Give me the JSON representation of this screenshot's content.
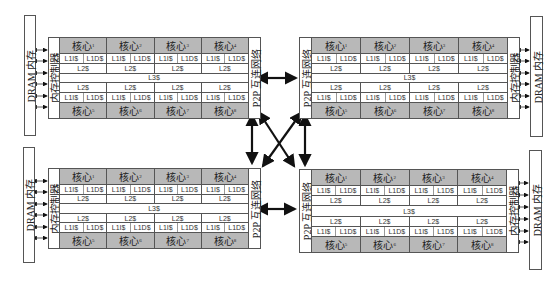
{
  "diagram": {
    "title": "",
    "labels": {
      "dram": "DRAM 内存",
      "memory_controller": "内存控制器",
      "p2p_network": "P2P 互连网络",
      "core_prefix": "核心",
      "l1i": "L1I$",
      "l1d": "L1D$",
      "l2": "L2$",
      "l3": "L3$"
    },
    "processors": [
      {
        "position": "top-left",
        "dram_label": "DRAM 内存",
        "controller_label": "内存控制器",
        "p2p_label": "P2P 互连网络",
        "top_cores": [
          "1",
          "2",
          "3",
          "4"
        ],
        "bottom_cores": [
          "5",
          "6",
          "7",
          "8"
        ]
      },
      {
        "position": "top-right",
        "dram_label": "DRAM 内存",
        "controller_label": "内存控制器",
        "p2p_label": "P2P 互连网络",
        "top_cores": [
          "1",
          "2",
          "3",
          "4"
        ],
        "bottom_cores": [
          "5",
          "6",
          "7",
          "8"
        ]
      },
      {
        "position": "bottom-left",
        "dram_label": "DRAM 内存",
        "controller_label": "内存控制器",
        "p2p_label": "P2P 互连网络",
        "top_cores": [
          "1",
          "2",
          "3",
          "4"
        ],
        "bottom_cores": [
          "5",
          "6",
          "7",
          "8"
        ]
      },
      {
        "position": "bottom-right",
        "dram_label": "DRAM 内存",
        "controller_label": "内存控制器",
        "p2p_label": "P2P 互连网络",
        "top_cores": [
          "1",
          "2",
          "3",
          "4"
        ],
        "bottom_cores": [
          "5",
          "6",
          "7",
          "8"
        ]
      }
    ],
    "connections": [
      {
        "from": "top-left",
        "to": "top-right",
        "type": "bidirectional"
      },
      {
        "from": "bottom-left",
        "to": "bottom-right",
        "type": "bidirectional"
      },
      {
        "from": "top-left",
        "to": "bottom-left",
        "type": "bidirectional"
      },
      {
        "from": "top-right",
        "to": "bottom-right",
        "type": "bidirectional"
      },
      {
        "from": "top-left",
        "to": "bottom-right",
        "type": "bidirectional"
      },
      {
        "from": "top-right",
        "to": "bottom-left",
        "type": "bidirectional"
      }
    ],
    "colors": {
      "core_fill": "#b8b8b8",
      "border": "#555555",
      "arrow": "#111111"
    }
  }
}
